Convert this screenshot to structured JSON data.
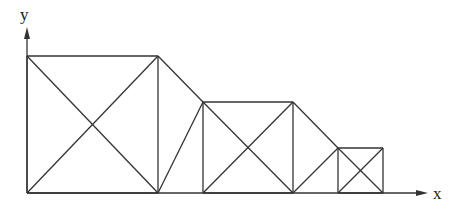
{
  "axes": {
    "x_label": "x",
    "y_label": "y",
    "origin": [
      27,
      193
    ],
    "x_end": 428,
    "y_end": 27
  },
  "stroke_color": "#333333",
  "squares": [
    {
      "name": "large",
      "left": 27,
      "top": 56,
      "right": 158,
      "bottom": 193
    },
    {
      "name": "medium",
      "left": 203,
      "top": 102,
      "right": 293,
      "bottom": 193
    },
    {
      "name": "small",
      "left": 338,
      "top": 148,
      "right": 383,
      "bottom": 193
    }
  ],
  "connectors": [
    {
      "from": [
        158,
        56
      ],
      "to": [
        203,
        102
      ]
    },
    {
      "from": [
        158,
        193
      ],
      "to": [
        203,
        102
      ]
    },
    {
      "from": [
        293,
        102
      ],
      "to": [
        338,
        148
      ]
    },
    {
      "from": [
        293,
        193
      ],
      "to": [
        338,
        148
      ]
    }
  ]
}
